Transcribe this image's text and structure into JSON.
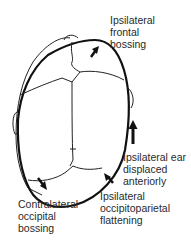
{
  "figure": {
    "colors": {
      "outline": "#111111",
      "sutures": "#222222",
      "text": "#2a2a2a",
      "background": "#ffffff"
    }
  },
  "labels": {
    "frontal": {
      "lines": [
        "Ipsilateral",
        "frontal",
        "bossing"
      ]
    },
    "ear": {
      "lines": [
        "Ipsilateral ear",
        "displaced",
        "anteriorly"
      ]
    },
    "occipitoparietal": {
      "lines": [
        "Ipsilateral",
        "occipitoparietal",
        "flattening"
      ]
    },
    "occipital": {
      "lines": [
        "Contralateral",
        "occipital",
        "bossing"
      ]
    }
  }
}
